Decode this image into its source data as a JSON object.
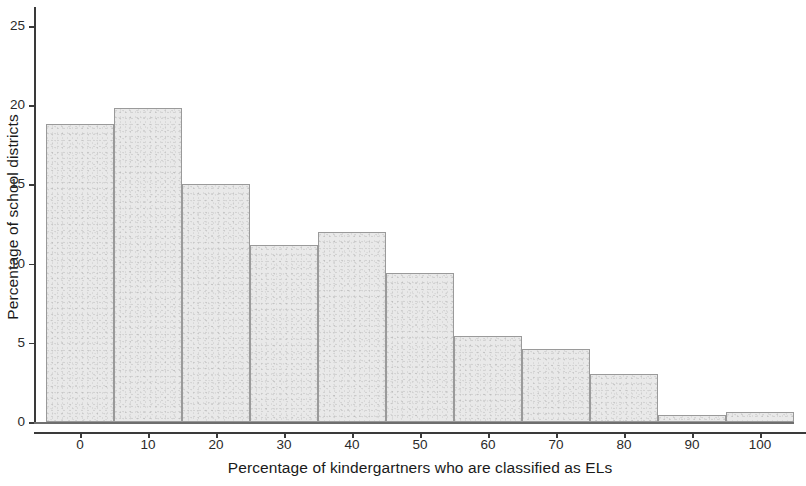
{
  "chart_data": {
    "type": "bar",
    "title": "",
    "subtitle": "",
    "xlabel": "Percentage of kindergartners who are classified as ELs",
    "ylabel": "Percentage of school districts",
    "grid": false,
    "legend": null,
    "bin_width": 10,
    "xlim": [
      -5,
      105
    ],
    "ylim": [
      0,
      26.2
    ],
    "xticks": [
      0,
      10,
      20,
      30,
      40,
      50,
      60,
      70,
      80,
      90,
      100
    ],
    "xtick_labels": [
      "0",
      "10",
      "20",
      "30",
      "40",
      "50",
      "60",
      "70",
      "80",
      "90",
      "100"
    ],
    "yticks": [
      0,
      5,
      10,
      15,
      20,
      25
    ],
    "ytick_labels": [
      "0",
      "5",
      "10",
      "15",
      "20",
      "25"
    ],
    "categories": [
      "0",
      "10",
      "20",
      "30",
      "40",
      "50",
      "60",
      "70",
      "80",
      "90",
      "100"
    ],
    "bin_edges": [
      -5,
      5,
      15,
      25,
      35,
      45,
      55,
      65,
      75,
      85,
      95,
      105
    ],
    "values": [
      18.8,
      19.8,
      15.0,
      11.2,
      12.0,
      9.4,
      5.4,
      4.6,
      3.0,
      0.45,
      0.6
    ],
    "bar_fill_color": "#e9e9e9",
    "bar_border_color": "#9a9a9a",
    "axis_color": "#3a3a3a",
    "text_color": "#1a1a1a"
  }
}
